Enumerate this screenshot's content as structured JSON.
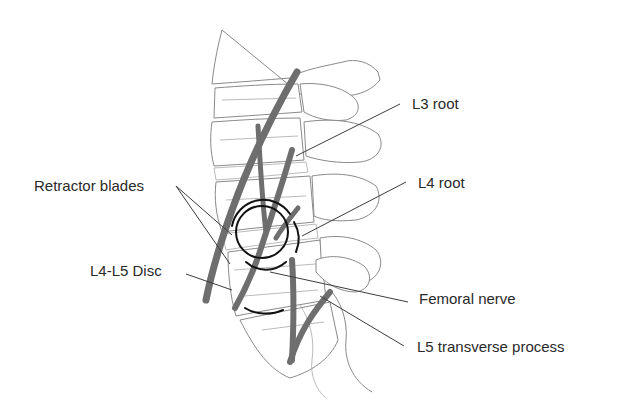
{
  "figure": {
    "colors": {
      "background": "#ffffff",
      "bone_outline": "#8a8a8a",
      "nerve": "#6e6e6e",
      "retractor": "#111111",
      "label_text": "#2a2a2a",
      "leader_line": "#3c3c3c"
    }
  },
  "labels": {
    "l3_root": "L3 root",
    "l4_root": "L4 root",
    "retractor_blades": "Retractor blades",
    "l4_l5_disc": "L4-L5 Disc",
    "femoral_nerve": "Femoral nerve",
    "l5_transverse_process": "L5 transverse process"
  }
}
